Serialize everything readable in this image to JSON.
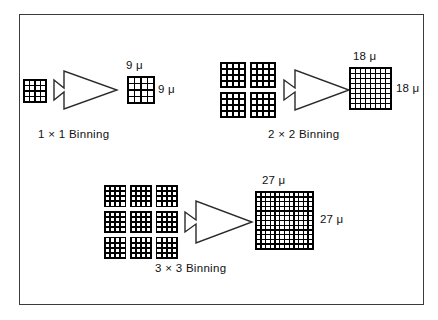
{
  "figure": {
    "background_color": "#ffffff",
    "border_color": "#3b3b3b",
    "block_color": "#000000",
    "cell_color": "#ffffff",
    "arrow_fill": "#ffffff",
    "arrow_stroke": "#2a2a2a"
  },
  "groups": [
    {
      "id": "binning-1x1",
      "caption": "1 × 1 Binning",
      "source": {
        "cluster_cols": 1,
        "cluster_rows": 1,
        "block_grid": 4,
        "block_count": 1
      },
      "result": {
        "grid": 4,
        "top_label": "9 μ",
        "side_label": "9 μ"
      }
    },
    {
      "id": "binning-2x2",
      "caption": "2 × 2 Binning",
      "source": {
        "cluster_cols": 2,
        "cluster_rows": 2,
        "block_grid": 4,
        "block_count": 4
      },
      "result": {
        "grid": 8,
        "top_label": "18 μ",
        "side_label": "18 μ"
      }
    },
    {
      "id": "binning-3x3",
      "caption": "3 × 3 Binning",
      "source": {
        "cluster_cols": 3,
        "cluster_rows": 3,
        "block_grid": 4,
        "block_count": 9
      },
      "result": {
        "grid": 12,
        "top_label": "27 μ",
        "side_label": "27 μ"
      }
    }
  ]
}
